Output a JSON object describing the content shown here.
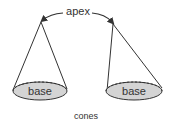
{
  "diagram": {
    "apex_label": "apex",
    "base_labels": [
      "base",
      "base"
    ],
    "caption": "cones",
    "colors": {
      "stroke": "#333333",
      "base_fill": "#d4d4d4",
      "text": "#333333"
    }
  }
}
